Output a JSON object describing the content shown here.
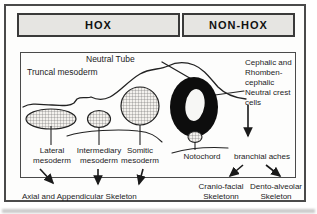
{
  "figure": {
    "header": {
      "hox": "HOX",
      "non_hox": "NON-HOX"
    },
    "diagram": {
      "neural_tube_label": "Neutral Tube",
      "truncal_mesoderm_label": "Truncal mesoderm",
      "crest_lines": [
        "Cephalic and",
        "Rhomben-",
        "cephalic",
        "Neutral crest",
        "cells"
      ],
      "lateral_label": "Lateral mesoderm",
      "intermediary_label": "Intermediary mesoderm",
      "somitic_label": "Somitic mesoderm",
      "notochord_label": "Notochord",
      "branchial_label": "branchial aches"
    },
    "outcomes": {
      "axial_label": "Axial and Appendicular Skeleton",
      "cranio_label": "Cranio-facial Skeletonn",
      "dento_label": "Dento-alveolar Skeleton"
    },
    "colors": {
      "frame": "#4a4a4a",
      "header_fill": "#e6e5e2",
      "ink": "#1c1c1c",
      "hatch": "#6b6b6b",
      "neural_tube_fill": "#0d0d0d"
    }
  }
}
